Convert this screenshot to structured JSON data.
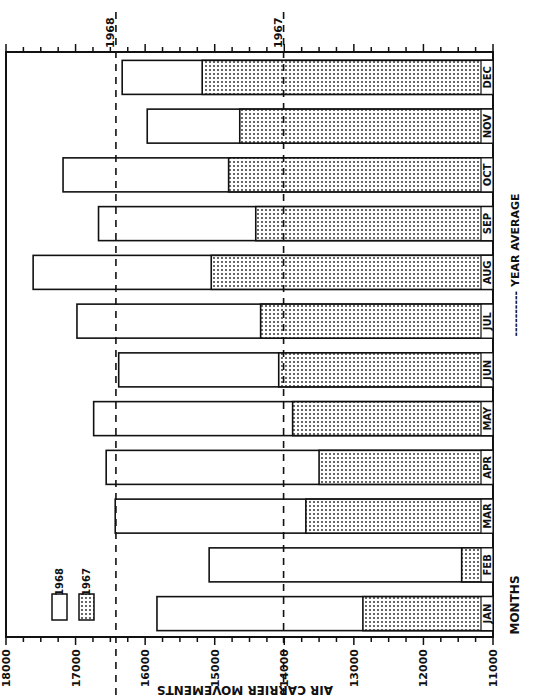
{
  "chart_data": {
    "type": "bar",
    "orientation": "rotated (horizontal bars, axis reversed; page rotated 90°)",
    "title": "",
    "xlabel": "MONTHS",
    "ylabel": "AIR CARRIER MOVEMENTS",
    "ylim": [
      11000,
      18000
    ],
    "y_ticks": [
      11000,
      12000,
      13000,
      14000,
      15000,
      16000,
      17000,
      18000
    ],
    "categories": [
      "JAN",
      "FEB",
      "MAR",
      "APR",
      "MAY",
      "JUN",
      "JUL",
      "AUG",
      "SEP",
      "OCT",
      "NOV",
      "DEC"
    ],
    "series": [
      {
        "name": "1968",
        "style": "white",
        "values": [
          15830,
          15080,
          16430,
          16560,
          16740,
          16380,
          16980,
          17610,
          16670,
          17180,
          15970,
          16330
        ]
      },
      {
        "name": "1967",
        "style": "stippled",
        "values": [
          12870,
          11450,
          13690,
          13500,
          13880,
          14080,
          14340,
          15050,
          14410,
          14800,
          14640,
          15180
        ]
      }
    ],
    "reference_lines": [
      {
        "label": "1968",
        "value": 16420,
        "style": "dashed",
        "meaning": "year average"
      },
      {
        "label": "1967",
        "value": 14010,
        "style": "dashed",
        "meaning": "year average"
      }
    ],
    "legend": {
      "entries": [
        {
          "label": "1968",
          "style": "white"
        },
        {
          "label": "1967",
          "style": "stippled"
        }
      ],
      "note": "---------- YEAR AVERAGE"
    },
    "grid": false
  },
  "labels": {
    "xlabel": "MONTHS",
    "ylabel": "AIR CARRIER MOVEMENTS",
    "year_average_note": "---------- YEAR AVERAGE",
    "legend_1968": "1968",
    "legend_1967": "1967",
    "avg_1968": "1968",
    "avg_1967": "1967"
  }
}
